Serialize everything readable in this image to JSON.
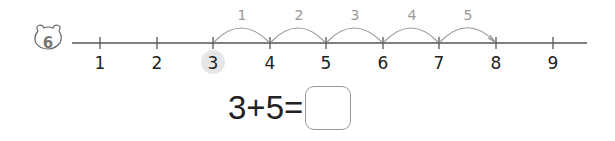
{
  "problem": {
    "number": "6",
    "badge_icon": "bear-face-icon"
  },
  "number_line": {
    "ticks": [
      "1",
      "2",
      "3",
      "4",
      "5",
      "6",
      "7",
      "8",
      "9"
    ],
    "highlighted_start": "3",
    "hop_labels": [
      "1",
      "2",
      "3",
      "4",
      "5"
    ],
    "end": "8"
  },
  "equation": {
    "left": "3",
    "operator": "+",
    "right": "5",
    "equals": "=",
    "answer": ""
  },
  "colors": {
    "line": "#555555",
    "hop_arc": "#999999",
    "hop_label": "#999999",
    "highlight": "#e6e6e6",
    "text": "#222222"
  }
}
